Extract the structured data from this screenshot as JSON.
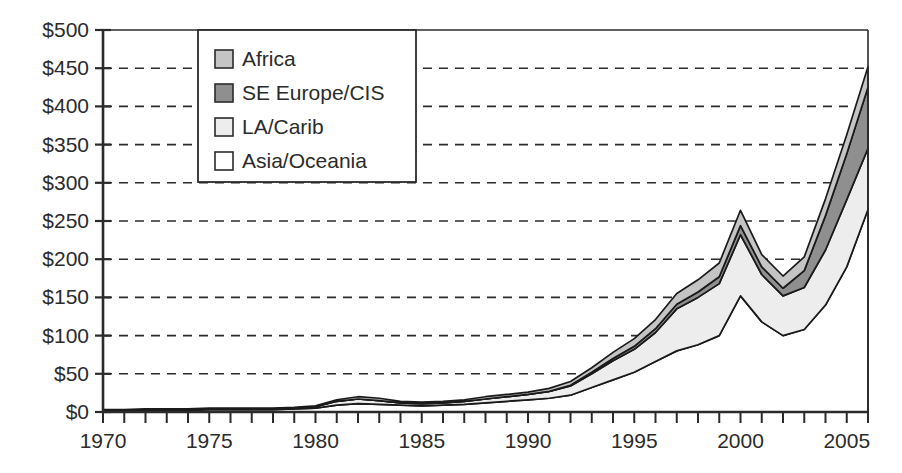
{
  "chart_data": {
    "type": "area",
    "stacked": true,
    "title": "",
    "subtitle": "",
    "xlabel": "",
    "ylabel": "",
    "xlim": [
      1970,
      2006
    ],
    "ylim": [
      0,
      500
    ],
    "ytick_step": 50,
    "xtick_step": 1,
    "xlabel_step": 5,
    "grid": true,
    "grid_style": "dashed-horizontal",
    "legend_position": "top-left-inside",
    "value_prefix": "$",
    "ytick_labels": [
      "$0",
      "$50",
      "$100",
      "$150",
      "$200",
      "$250",
      "$300",
      "$350",
      "$400",
      "$450",
      "$500"
    ],
    "ytick_values": [
      0,
      50,
      100,
      150,
      200,
      250,
      300,
      350,
      400,
      450,
      500
    ],
    "xtick_values": [
      1970,
      1971,
      1972,
      1973,
      1974,
      1975,
      1976,
      1977,
      1978,
      1979,
      1980,
      1981,
      1982,
      1983,
      1984,
      1985,
      1986,
      1987,
      1988,
      1989,
      1990,
      1991,
      1992,
      1993,
      1994,
      1995,
      1996,
      1997,
      1998,
      1999,
      2000,
      2001,
      2002,
      2003,
      2004,
      2005,
      2006
    ],
    "xtick_labels": [
      "1970",
      "1975",
      "1980",
      "1985",
      "1990",
      "1995",
      "2000",
      "2005"
    ],
    "xtick_label_values": [
      1970,
      1975,
      1980,
      1985,
      1990,
      1995,
      2000,
      2005
    ],
    "x": [
      1970,
      1971,
      1972,
      1973,
      1974,
      1975,
      1976,
      1977,
      1978,
      1979,
      1980,
      1981,
      1982,
      1983,
      1984,
      1985,
      1986,
      1987,
      1988,
      1989,
      1990,
      1991,
      1992,
      1993,
      1994,
      1995,
      1996,
      1997,
      1998,
      1999,
      2000,
      2001,
      2002,
      2003,
      2004,
      2005,
      2006
    ],
    "series": [
      {
        "name": "Asia/Oceania",
        "color": "#ffffff",
        "stack_order": 1,
        "values": [
          1,
          1,
          2,
          2,
          2,
          3,
          3,
          3,
          3,
          4,
          5,
          9,
          11,
          10,
          9,
          8,
          9,
          10,
          12,
          14,
          16,
          18,
          22,
          32,
          42,
          52,
          66,
          80,
          88,
          100,
          152,
          118,
          100,
          108,
          140,
          190,
          265
        ]
      },
      {
        "name": "LA/Carib",
        "color": "#ededed",
        "stack_order": 2,
        "values": [
          1,
          1,
          1,
          1,
          1,
          1,
          1,
          1,
          1,
          1,
          2,
          5,
          6,
          5,
          3,
          3,
          3,
          4,
          5,
          6,
          7,
          9,
          12,
          18,
          25,
          30,
          38,
          55,
          62,
          68,
          80,
          62,
          52,
          55,
          72,
          88,
          80
        ]
      },
      {
        "name": "SE Europe/CIS",
        "color": "#8f8f8f",
        "stack_order": 3,
        "values": [
          0,
          0,
          0,
          0,
          0,
          0,
          0,
          0,
          0,
          0,
          0,
          0,
          0,
          0,
          0,
          0,
          0,
          0,
          0,
          0,
          0,
          0,
          1,
          2,
          3,
          4,
          5,
          6,
          7,
          9,
          12,
          10,
          10,
          22,
          45,
          60,
          80
        ]
      },
      {
        "name": "Africa",
        "color": "#c4c4c4",
        "stack_order": 4,
        "values": [
          1,
          1,
          1,
          1,
          1,
          1,
          1,
          1,
          1,
          1,
          1,
          2,
          3,
          3,
          2,
          2,
          2,
          2,
          3,
          3,
          3,
          4,
          5,
          6,
          8,
          10,
          12,
          14,
          16,
          18,
          20,
          16,
          16,
          18,
          22,
          25,
          27
        ]
      }
    ],
    "totals": [
      3,
      3,
      4,
      4,
      4,
      5,
      5,
      5,
      5,
      6,
      8,
      16,
      20,
      18,
      14,
      13,
      14,
      16,
      20,
      23,
      26,
      31,
      40,
      58,
      78,
      96,
      121,
      155,
      173,
      195,
      264,
      206,
      178,
      203,
      279,
      363,
      452
    ]
  },
  "legend": {
    "items": [
      {
        "label": "Africa",
        "swatch": "#c4c4c4"
      },
      {
        "label": "SE Europe/CIS",
        "swatch": "#8f8f8f"
      },
      {
        "label": "LA/Carib",
        "swatch": "#ededed"
      },
      {
        "label": "Asia/Oceania",
        "swatch": "#ffffff"
      }
    ]
  }
}
